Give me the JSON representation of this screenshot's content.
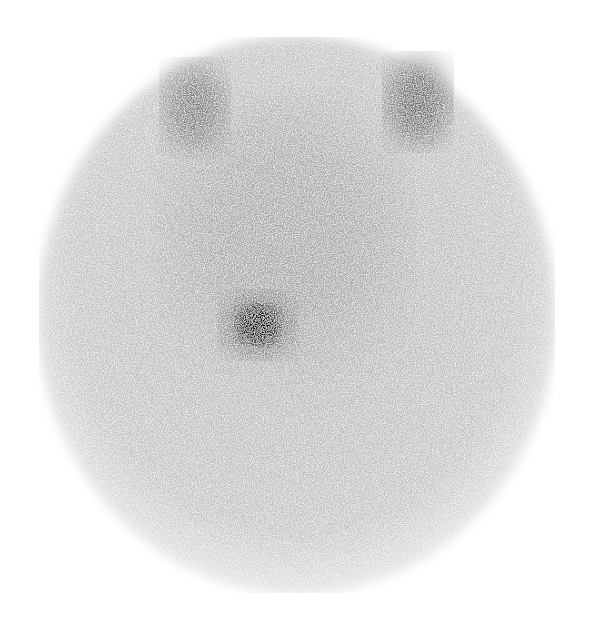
{
  "image": {
    "type": "planar scintigraphy (grayscale)",
    "description": "Circular gamma-camera field of view with noisy background uptake; two symmetric darker regions at the upper left and upper right, and a single focal dark hot spot left of center in the mid-lower field.",
    "background_color": "#ffffff",
    "field": {
      "cx": 297,
      "cy": 315,
      "rx": 258,
      "ry": 278,
      "tone": "#bdbdbd"
    },
    "regions": [
      {
        "name": "upper-left-uptake",
        "cx": 195,
        "cy": 108,
        "rx": 32,
        "ry": 45,
        "tone": "#6e6e6e"
      },
      {
        "name": "upper-right-uptake",
        "cx": 418,
        "cy": 102,
        "rx": 32,
        "ry": 45,
        "tone": "#5e5e5e"
      },
      {
        "name": "central-diffuse-uptake",
        "cx": 285,
        "cy": 230,
        "rx": 110,
        "ry": 120,
        "tone": "#9a9a9a"
      },
      {
        "name": "focal-hot-spot",
        "cx": 258,
        "cy": 325,
        "rx": 26,
        "ry": 24,
        "tone": "#111111"
      }
    ]
  }
}
